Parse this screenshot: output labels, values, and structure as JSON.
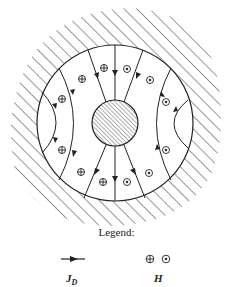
{
  "diagram": {
    "colors": {
      "line": "#222222",
      "background": "#ffffff"
    },
    "symbols": {
      "into_page": "⊕",
      "out_of_page": "⊙"
    }
  },
  "legend": {
    "title": "Legend:",
    "jd_label_main": "J",
    "jd_label_sub": "D",
    "h_label": "H",
    "h_symbols": "⊕ ⊙"
  }
}
